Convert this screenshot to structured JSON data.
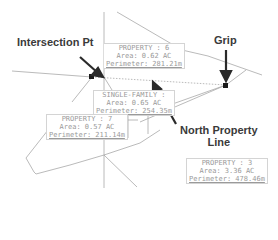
{
  "drawing": {
    "type": "cad-parcel-layout",
    "colors": {
      "background": "#ffffff",
      "parcel_line": "#a8a8a8",
      "callout_text": "#3a3a3a",
      "label_text": "#9a9a9a",
      "grip": "#1a1a1a"
    }
  },
  "callouts": {
    "intersection": "Intersection Pt",
    "grip": "Grip",
    "north_line_1": "North Property",
    "north_line_2": "Line"
  },
  "parcels": [
    {
      "id": "property-6",
      "name": "PROPERTY : 6",
      "area": "Area: 0.62 AC",
      "perimeter": "Perimeter: 281.21m"
    },
    {
      "id": "single-family",
      "name": "SINGLE-FAMILY :",
      "area": "Area: 0.65 AC",
      "perimeter": "Perimeter: 254.35m"
    },
    {
      "id": "property-7",
      "name": "PROPERTY : 7",
      "area": "Area: 0.57 AC",
      "perimeter": "Perimeter: 211.14m"
    },
    {
      "id": "property-3",
      "name": "PROPERTY : 3",
      "area": "Area: 3.36 AC",
      "perimeter": "Perimeter: 478.46m"
    }
  ]
}
